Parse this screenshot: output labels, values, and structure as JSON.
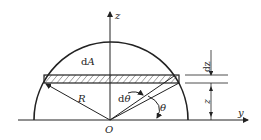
{
  "diagram": {
    "type": "geometry",
    "labels": {
      "z_axis": "z",
      "y_axis": "y",
      "origin": "O",
      "radius": "R",
      "area_element_d": "d",
      "area_element_A": "A",
      "dtheta_d": "d",
      "dtheta_theta": "θ",
      "theta": "θ",
      "dz_label": "dz",
      "z_height": "z"
    },
    "colors": {
      "stroke": "#222222",
      "background": "#ffffff"
    }
  }
}
